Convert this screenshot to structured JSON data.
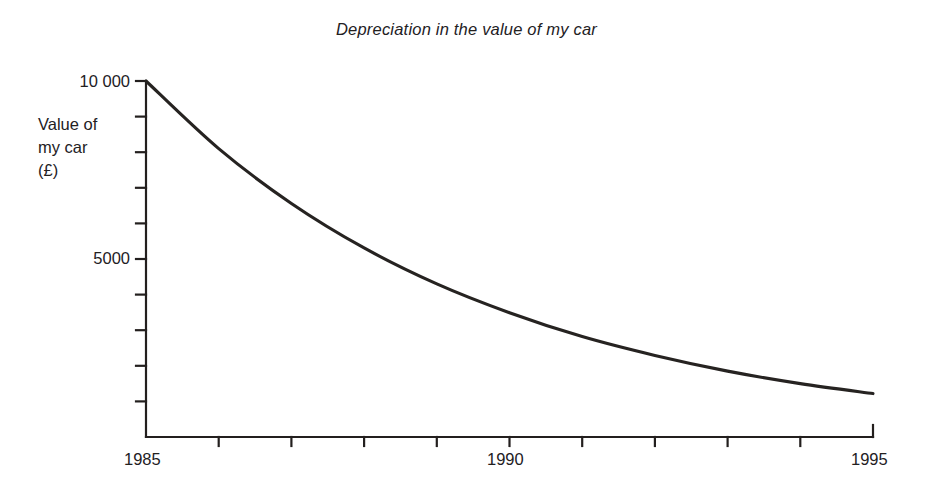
{
  "chart_data": {
    "type": "line",
    "title": "Depreciation in the value of my car",
    "xlabel": "",
    "ylabel": "Value of my car (£)",
    "ylabel_lines": [
      "Value of",
      "my car",
      "(£)"
    ],
    "x": [
      1985,
      1986,
      1987,
      1988,
      1989,
      1990,
      1991,
      1992,
      1993,
      1994,
      1995
    ],
    "values": [
      10000,
      8100,
      6560,
      5310,
      4300,
      3490,
      2820,
      2290,
      1850,
      1500,
      1220
    ],
    "series": [
      {
        "name": "Value of my car (£)",
        "values": [
          10000,
          8100,
          6560,
          5310,
          4300,
          3490,
          2820,
          2290,
          1850,
          1500,
          1220
        ]
      }
    ],
    "xlim": [
      1985,
      1995
    ],
    "ylim": [
      0,
      10000
    ],
    "x_tick_values": [
      1985,
      1986,
      1987,
      1988,
      1989,
      1990,
      1991,
      1992,
      1993,
      1994,
      1995
    ],
    "x_tick_labels_shown": [
      "1985",
      "1990",
      "1995"
    ],
    "x_labelled_ticks": [
      1985,
      1990,
      1995
    ],
    "y_tick_values": [
      0,
      1000,
      2000,
      3000,
      4000,
      5000,
      6000,
      7000,
      8000,
      9000,
      10000
    ],
    "y_tick_labels_shown": [
      "5000",
      "10 000"
    ],
    "y_labelled_ticks": [
      5000,
      10000
    ],
    "grid": false,
    "legend": false,
    "legend_position": "none",
    "curve_color": "#262321",
    "axis_color": "#231f1e",
    "background_color": "#ffffff",
    "annotation": "Exponential decay, approximately 19% loss of value per year"
  },
  "labels": {
    "y_10000": "10 000",
    "y_5000": "5000",
    "x_1985": "1985",
    "x_1990": "1990",
    "x_1995": "1995"
  }
}
